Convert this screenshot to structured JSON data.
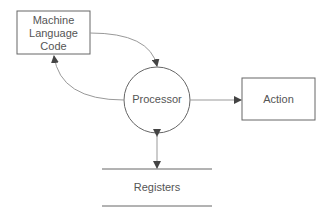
{
  "diagram": {
    "nodes": {
      "code": {
        "label_lines": [
          "Machine",
          "Language",
          "Code"
        ]
      },
      "processor": {
        "label": "Processor"
      },
      "action": {
        "label": "Action"
      },
      "registers": {
        "label": "Registers"
      }
    },
    "edges": [
      {
        "from": "code",
        "to": "processor"
      },
      {
        "from": "processor",
        "to": "code"
      },
      {
        "from": "processor",
        "to": "action"
      },
      {
        "from": "processor",
        "to": "registers",
        "bidirectional": true
      }
    ],
    "colors": {
      "stroke": "#666666",
      "text": "#555555"
    }
  }
}
